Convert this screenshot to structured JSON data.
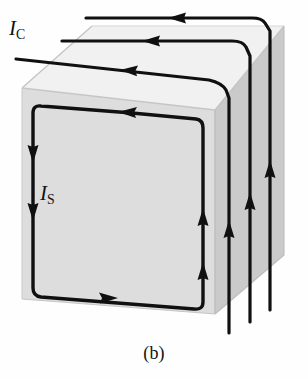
{
  "figure": {
    "caption": "(b)",
    "labels": {
      "conduction_current": {
        "symbol": "I",
        "subscript": "C",
        "full": "I_C"
      },
      "surface_current": {
        "symbol": "I",
        "subscript": "S",
        "full": "I_S"
      }
    },
    "colors": {
      "front_face": "#dcdcdc",
      "top_face": "#f2f2f2",
      "right_face": "#c9c9c9",
      "line": "#101010",
      "background": "#ffffff",
      "edge": "#b4b4b4"
    },
    "counts": {
      "top_face_current_lines": 3,
      "right_face_current_lines": 3,
      "surface_loop_arrows": 6
    }
  }
}
